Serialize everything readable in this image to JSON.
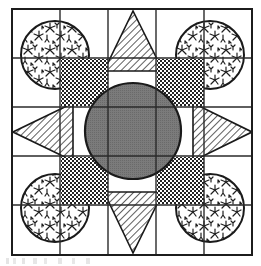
{
  "figure": {
    "canvas": {
      "width": 261,
      "height": 266,
      "background": "#ffffff"
    },
    "colors": {
      "ink": "#1a1a1a",
      "frame": "#1c1c1c",
      "grid": "#2a2a2a",
      "center_circle_fill": "#7b7b7b",
      "center_circle_stroke": "#1a1a1a",
      "hatch_stroke": "#2b2b2b",
      "checker_dark": "#232323",
      "checker_light": "#ffffff",
      "vegetation_stroke": "#1f1f1f",
      "paper": "#ffffff"
    },
    "frame": {
      "name": "outer-border",
      "x": 12,
      "y": 9,
      "width": 240,
      "height": 246,
      "stroke_width": 2.0
    },
    "grid": {
      "name": "ruled-grid",
      "columns": 5,
      "rows": 5,
      "vertical_lines_x": [
        60,
        108,
        156,
        204
      ],
      "horizontal_lines_y": [
        58,
        107,
        156,
        205
      ],
      "stroke_width": 1.4
    },
    "center_circle": {
      "name": "central-disc",
      "cx": 133,
      "cy": 131,
      "r": 48,
      "fill_label": "solid mid-gray",
      "stroke_width": 2.2
    },
    "triangles": [
      {
        "name": "star-point-north",
        "points": "133,11 104,71 163,71",
        "hatch": "diagonal-45"
      },
      {
        "name": "star-point-south",
        "points": "133,253 104,192 163,192",
        "hatch": "diagonal-45"
      },
      {
        "name": "star-point-west",
        "points": "13,132 73,103 73,161",
        "hatch": "diagonal-45"
      },
      {
        "name": "star-point-east",
        "points": "252,132 193,103 193,161",
        "hatch": "diagonal-45"
      }
    ],
    "checker_squares": [
      {
        "name": "checker-square-top-left",
        "x": 61,
        "y": 59,
        "width": 47,
        "height": 47
      },
      {
        "name": "checker-square-top-right",
        "x": 157,
        "y": 59,
        "width": 47,
        "height": 47
      },
      {
        "name": "checker-square-bottom-left",
        "x": 61,
        "y": 157,
        "width": 47,
        "height": 47
      },
      {
        "name": "checker-square-bottom-right",
        "x": 157,
        "y": 157,
        "width": 47,
        "height": 47
      }
    ],
    "corner_circles": [
      {
        "name": "vegetation-circle-top-left",
        "cx": 55,
        "cy": 55,
        "r": 34
      },
      {
        "name": "vegetation-circle-top-right",
        "cx": 210,
        "cy": 55,
        "r": 34
      },
      {
        "name": "vegetation-circle-bottom-left",
        "cx": 55,
        "cy": 208,
        "r": 34
      },
      {
        "name": "vegetation-circle-bottom-right",
        "cx": 210,
        "cy": 208,
        "r": 34
      }
    ],
    "legend_note": ""
  }
}
